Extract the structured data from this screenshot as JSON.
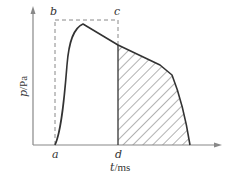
{
  "diagram": {
    "type": "pressure-time waveform",
    "axes": {
      "y_label_var": "p",
      "y_label_unit": "/Pa",
      "x_label_var": "t",
      "x_label_unit": "/ms"
    },
    "points": {
      "a": "a",
      "b": "b",
      "c": "c",
      "d": "d"
    },
    "colors": {
      "axis": "#888888",
      "curve": "#333333",
      "dashed": "#888888",
      "hatch": "#555555",
      "text": "#333333"
    }
  }
}
